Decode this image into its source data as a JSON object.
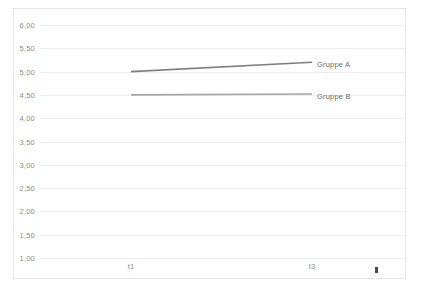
{
  "chart_data": {
    "type": "line",
    "title": "",
    "subtitle": "",
    "xlabel": "",
    "ylabel": "",
    "x": [
      "t1",
      "t3"
    ],
    "categories": [
      "t1",
      "t3"
    ],
    "series": [
      {
        "name": "Gruppe A",
        "values": [
          5.0,
          5.2
        ],
        "color": "#7f7f7f"
      },
      {
        "name": "Gruppe B",
        "values": [
          4.5,
          4.52
        ],
        "color": "#a6a6a6"
      }
    ],
    "ylim": [
      1.0,
      6.0
    ],
    "ytick_values": [
      6.0,
      5.5,
      5.0,
      4.5,
      4.0,
      3.5,
      3.0,
      2.5,
      2.0,
      1.5,
      1.0
    ],
    "ytick_labels": [
      "6,00",
      "5,50",
      "5,00",
      "4,50",
      "4,00",
      "3,50",
      "3,00",
      "2,50",
      "2,00",
      "1,50",
      "1,00"
    ],
    "xtick_labels": [
      "t1",
      "t3"
    ],
    "grid": true,
    "grid_axis": "y",
    "legend": "inline-series-labels",
    "legend_position": "right-of-line-ends",
    "grid_color": "#ededed",
    "frame_color": "#e6e6e6",
    "tick_label_color": "#8c8c8c",
    "series_label_color": "#6b6b6b"
  },
  "axes": {
    "y_labels": [
      {
        "text": "6,00",
        "value": 6.0
      },
      {
        "text": "5,50",
        "value": 5.5
      },
      {
        "text": "5,00",
        "value": 5.0
      },
      {
        "text": "4,50",
        "value": 4.5
      },
      {
        "text": "4,00",
        "value": 4.0
      },
      {
        "text": "3,50",
        "value": 3.5
      },
      {
        "text": "3,00",
        "value": 3.0
      },
      {
        "text": "2,50",
        "value": 2.5
      },
      {
        "text": "2,00",
        "value": 2.0
      },
      {
        "text": "1,50",
        "value": 1.5
      },
      {
        "text": "1,00",
        "value": 1.0
      }
    ],
    "x_labels": [
      {
        "text": "t1",
        "x_px": 131
      },
      {
        "text": "t3",
        "x_px": 312
      }
    ]
  },
  "series_labels": [
    {
      "text": "Gruppe A",
      "x_px": 317,
      "y_px": 64
    },
    {
      "text": "Gruppe B",
      "x_px": 317,
      "y_px": 96
    }
  ]
}
